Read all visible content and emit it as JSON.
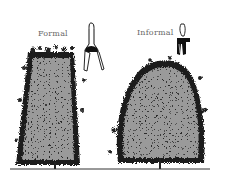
{
  "illustration": {
    "subject": "hedge pruning styles comparison",
    "labels": {
      "formal": "Formal",
      "informal": "Informal"
    },
    "tools": {
      "formal": "hedge-shears-icon",
      "informal": "hand-pruners-icon"
    },
    "colors": {
      "background": "#ffffff",
      "foliage_fill": "#9a9a9a",
      "foliage_dark": "#1a1a1a",
      "label_text": "#6a6a6a",
      "ground_line": "#333333"
    }
  }
}
